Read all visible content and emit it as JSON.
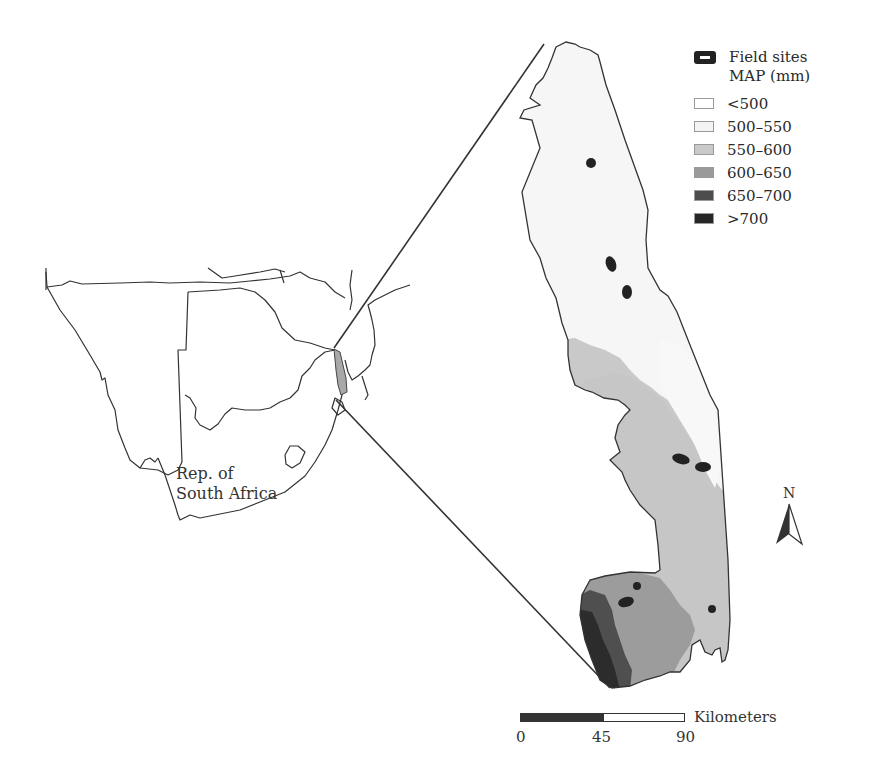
{
  "legend": {
    "sites_label": "Field sites",
    "map_title": "MAP (mm)",
    "classes": [
      {
        "label": "<500",
        "color": "#ffffff"
      },
      {
        "label": "500–550",
        "color": "#f4f4f4"
      },
      {
        "label": "550–600",
        "color": "#c9c9c9"
      },
      {
        "label": "600–650",
        "color": "#9a9a9a"
      },
      {
        "label": "650–700",
        "color": "#4d4d4d"
      },
      {
        "label": ">700",
        "color": "#262626"
      }
    ]
  },
  "inset": {
    "country_label_line1": "Rep. of",
    "country_label_line2": "South Africa"
  },
  "north_arrow": {
    "label": "N"
  },
  "scalebar": {
    "unit": "Kilometers",
    "ticks": [
      "0",
      "45",
      "90"
    ]
  },
  "colors": {
    "outline": "#333333",
    "site": "#222222"
  }
}
